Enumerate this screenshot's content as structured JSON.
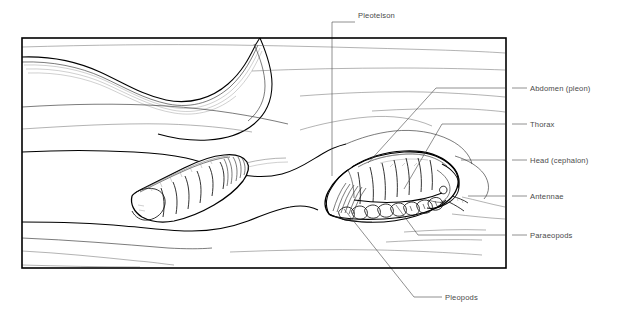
{
  "figure": {
    "frame": {
      "x": 22,
      "y": 38,
      "width": 484,
      "height": 230
    },
    "ink_color": "#000000",
    "label_color": "#4a4a4a",
    "background_color": "#ffffff"
  },
  "labels": {
    "pleotelson": "Pleotelson",
    "abdomen": "Abdomen (pleon)",
    "thorax": "Thorax",
    "head": "Head (cephalon)",
    "antennae": "Antennae",
    "paraeopods": "Paraeopods",
    "pleopods": "Pleopods"
  },
  "label_positions": {
    "pleotelson": {
      "x": 358,
      "y": 12
    },
    "abdomen": {
      "x": 530,
      "y": 85
    },
    "thorax": {
      "x": 530,
      "y": 121
    },
    "head": {
      "x": 530,
      "y": 157
    },
    "antennae": {
      "x": 530,
      "y": 193
    },
    "paraeopods": {
      "x": 530,
      "y": 232
    },
    "pleopods": {
      "x": 445,
      "y": 294
    }
  },
  "specimens": [
    {
      "name": "left-isopod",
      "description": "partially buried isopod, head to lower-left, segmented thorax, tail to upper-right",
      "orientation": "head-left"
    },
    {
      "name": "right-isopod",
      "description": "detailed isopod in burrow, pleotelson at left, head and antennae at right, pleopods beneath",
      "orientation": "head-right"
    }
  ],
  "leader_lines": [
    {
      "name": "pleotelson-leader",
      "from": "label",
      "to": "tail-of-right-isopod"
    },
    {
      "name": "abdomen-leader",
      "from": "label",
      "to": "posterior-dorsal-segments"
    },
    {
      "name": "thorax-leader",
      "from": "label",
      "to": "mid-dorsal-segments"
    },
    {
      "name": "head-leader",
      "from": "label",
      "to": "cephalon"
    },
    {
      "name": "antennae-leader",
      "from": "label",
      "to": "antennae-tip"
    },
    {
      "name": "paraeopods-leader",
      "from": "label",
      "to": "walking-legs"
    },
    {
      "name": "pleopods-leader",
      "from": "label",
      "to": "ventral-pleopods"
    }
  ]
}
